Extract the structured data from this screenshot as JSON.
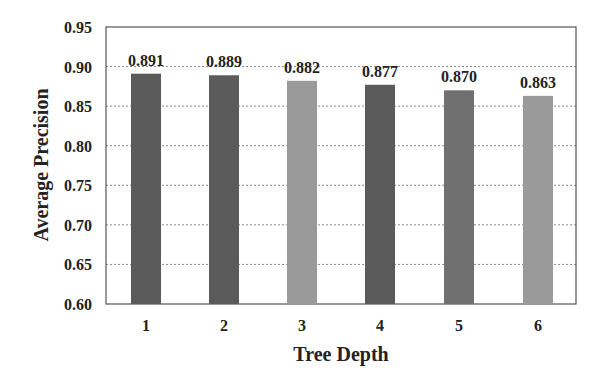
{
  "chart_data": {
    "type": "bar",
    "title": "",
    "xlabel": "Tree Depth",
    "ylabel": "Average Precision",
    "categories": [
      "1",
      "2",
      "3",
      "4",
      "5",
      "6"
    ],
    "values": [
      0.891,
      0.889,
      0.882,
      0.877,
      0.87,
      0.863
    ],
    "data_labels": [
      "0.891",
      "0.889",
      "0.882",
      "0.877",
      "0.870",
      "0.863"
    ],
    "ylim": [
      0.6,
      0.95
    ],
    "yticks": [
      "0.60",
      "0.65",
      "0.70",
      "0.75",
      "0.80",
      "0.85",
      "0.90",
      "0.95"
    ],
    "grid": "horizontal dotted",
    "legend": "none",
    "bar_colors": [
      "#5a5a5a",
      "#5a5a5a",
      "#9a9a9a",
      "#5a5a5a",
      "#707070",
      "#9a9a9a"
    ]
  }
}
